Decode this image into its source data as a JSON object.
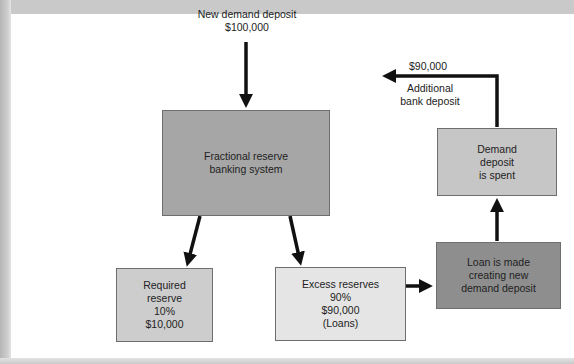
{
  "diagram": {
    "title_fragment": "",
    "source": {
      "line1": "New demand deposit",
      "line2": "$100,000"
    },
    "nodes": {
      "system": {
        "text": "Fractional reserve\nbanking system",
        "color": "#a6a6a6"
      },
      "required": {
        "text": "Required\nreserve\n10%\n$10,000",
        "color": "#cdcdcd"
      },
      "excess": {
        "text": "Excess reserves\n90%\n$90,000\n(Loans)",
        "color": "#e5e5e5"
      },
      "loan": {
        "text": "Loan is made\ncreating new\ndemand deposit",
        "color": "#8e8e8e"
      },
      "spent": {
        "text": "Demand\ndeposit\nis spent",
        "color": "#c6c6c6"
      }
    },
    "feedback": {
      "amount": "$90,000",
      "line1": "Additional",
      "line2": "bank deposit"
    },
    "edges": [
      {
        "from": "source",
        "to": "system"
      },
      {
        "from": "system",
        "to": "required"
      },
      {
        "from": "system",
        "to": "excess"
      },
      {
        "from": "excess",
        "to": "loan"
      },
      {
        "from": "loan",
        "to": "spent"
      },
      {
        "from": "spent",
        "to": "system",
        "label": "$90,000 Additional bank deposit"
      }
    ]
  }
}
